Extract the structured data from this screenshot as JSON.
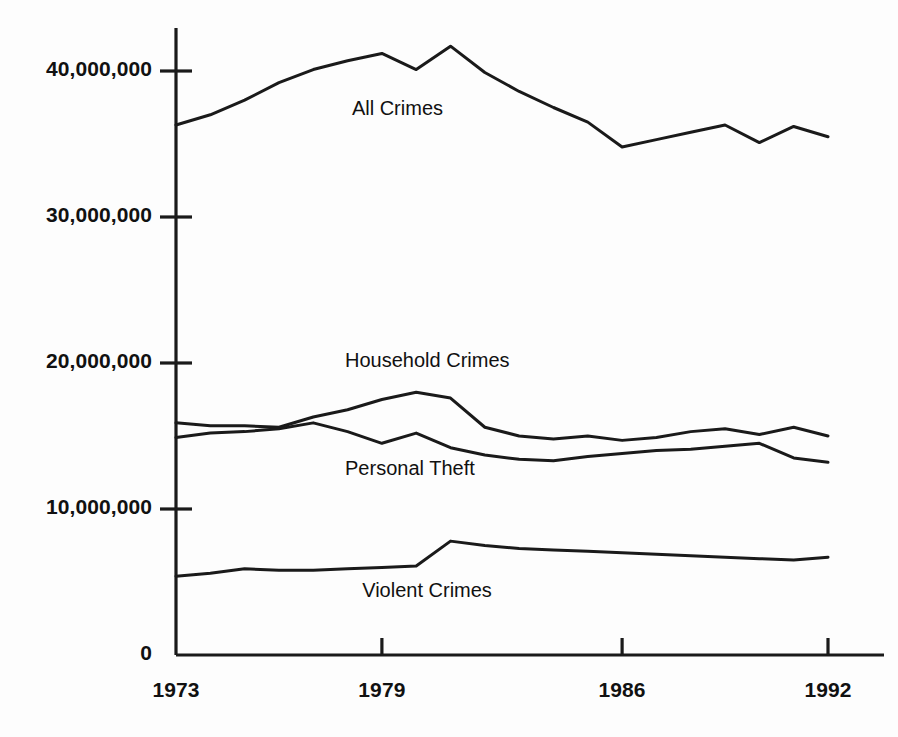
{
  "chart_data": {
    "type": "line",
    "title": "",
    "subtitle": "",
    "xlabel": "",
    "ylabel": "",
    "grid": false,
    "legend_position": "inline-annotations",
    "x": [
      1973,
      1974,
      1975,
      1976,
      1977,
      1978,
      1979,
      1980,
      1981,
      1982,
      1983,
      1984,
      1985,
      1986,
      1987,
      1988,
      1989,
      1990,
      1991,
      1992
    ],
    "xlim": [
      1973,
      1992
    ],
    "ylim": [
      0,
      42000000
    ],
    "xticks": [
      1973,
      1979,
      1986,
      1992
    ],
    "xtick_labels": [
      "1973",
      "1979",
      "1986",
      "1992"
    ],
    "yticks": [
      0,
      10000000,
      20000000,
      30000000,
      40000000
    ],
    "ytick_labels": [
      "0",
      "10,000,000",
      "20,000,000",
      "30,000,000",
      "40,000,000"
    ],
    "series": [
      {
        "name": "All Crimes",
        "values": [
          36300000,
          37000000,
          38000000,
          39200000,
          40100000,
          40700000,
          41200000,
          40100000,
          41700000,
          39900000,
          38600000,
          37500000,
          36500000,
          34800000,
          35300000,
          35800000,
          36300000,
          35100000,
          36200000,
          35500000
        ]
      },
      {
        "name": "Household Crimes",
        "values": [
          15900000,
          15700000,
          15700000,
          15600000,
          16300000,
          16800000,
          17500000,
          18000000,
          17600000,
          15600000,
          15000000,
          14800000,
          15000000,
          14700000,
          14900000,
          15300000,
          15500000,
          15100000,
          15600000,
          15000000
        ]
      },
      {
        "name": "Personal Theft",
        "values": [
          14900000,
          15200000,
          15300000,
          15500000,
          15900000,
          15300000,
          14500000,
          15200000,
          14200000,
          13700000,
          13400000,
          13300000,
          13600000,
          13800000,
          14000000,
          14100000,
          14300000,
          14500000,
          13500000,
          13200000
        ]
      },
      {
        "name": "Violent Crimes",
        "values": [
          5400000,
          5600000,
          5900000,
          5800000,
          5800000,
          5900000,
          6000000,
          6100000,
          7800000,
          7500000,
          7300000,
          7200000,
          7100000,
          7000000,
          6900000,
          6800000,
          6700000,
          6600000,
          6500000,
          6700000
        ]
      }
    ],
    "annotations": [
      {
        "text": "All Crimes",
        "x": 1979,
        "y": 37300000
      },
      {
        "text": "Household Crimes",
        "x": 1978.8,
        "y": 20100000
      },
      {
        "text": "Personal Theft",
        "x": 1978.8,
        "y": 12700000
      },
      {
        "text": "Violent Crimes",
        "x": 1979.3,
        "y": 4300000
      }
    ],
    "colors": {
      "line": "#1a1a1a",
      "axis": "#1a1a1a",
      "background": "#fdfdfd",
      "text": "#111111"
    }
  }
}
